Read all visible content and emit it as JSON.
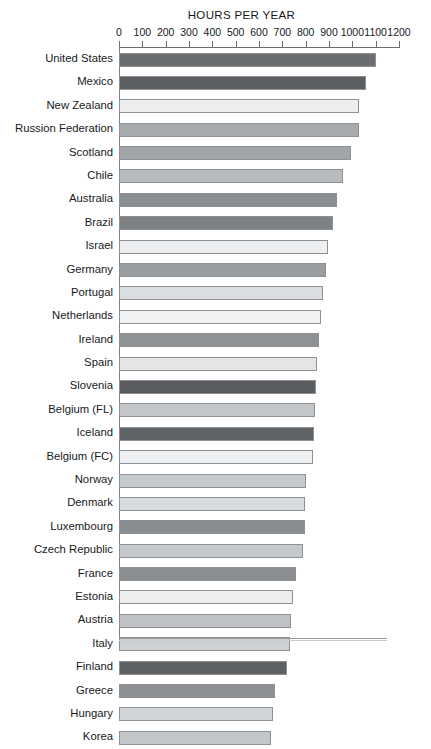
{
  "chart_data": {
    "type": "bar",
    "orientation": "horizontal",
    "title": "HOURS PER YEAR",
    "xlabel": "",
    "ylabel": "",
    "xlim": [
      0,
      1200
    ],
    "xticks": [
      0,
      100,
      200,
      300,
      400,
      500,
      600,
      700,
      800,
      900,
      1000,
      1100,
      1200
    ],
    "grid": false,
    "legend": null,
    "categories": [
      "United States",
      "Mexico",
      "New Zealand",
      "Russion Federation",
      "Scotland",
      "Chile",
      "Australia",
      "Brazil",
      "Israel",
      "Germany",
      "Portugal",
      "Netherlands",
      "Ireland",
      "Spain",
      "Slovenia",
      "Belgium (FL)",
      "Iceland",
      "Belgium (FC)",
      "Norway",
      "Denmark",
      "Luxembourg",
      "Czech Republic",
      "France",
      "Estonia",
      "Austria",
      "Italy",
      "Finland",
      "Greece",
      "Hungary",
      "Korea"
    ],
    "values": [
      1100,
      1060,
      1028,
      1028,
      995,
      960,
      935,
      915,
      895,
      885,
      875,
      865,
      855,
      850,
      843,
      840,
      835,
      830,
      800,
      795,
      795,
      790,
      757,
      744,
      735,
      733,
      722,
      667,
      658,
      650
    ],
    "bar_colors": [
      "#6b6e71",
      "#5c5f62",
      "#eceeef",
      "#a8abae",
      "#a2a5a8",
      "#b9bcbe",
      "#8b8e91",
      "#7f8285",
      "#eceeef",
      "#9a9da0",
      "#dcdfe1",
      "#f0f2f3",
      "#8f9295",
      "#e3e5e7",
      "#5a5d60",
      "#c3c6c8",
      "#616467",
      "#eff1f2",
      "#c8cbcd",
      "#d9dcde",
      "#8a8d90",
      "#c6c9cb",
      "#8b8e91",
      "#eceeef",
      "#bfc2c4",
      "#ced1d3",
      "#5f6265",
      "#8d9093",
      "#d2d5d7",
      "#c4c7c9"
    ]
  },
  "axis": {
    "tick_labels": [
      "0",
      "100",
      "200",
      "300",
      "400",
      "500",
      "600",
      "700",
      "800",
      "900",
      "1000",
      "1100",
      "1200"
    ]
  }
}
